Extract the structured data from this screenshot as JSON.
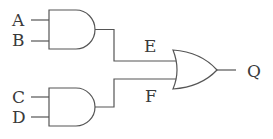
{
  "diagram": {
    "type": "logic-circuit",
    "inputs": [
      {
        "id": "A",
        "label": "A"
      },
      {
        "id": "B",
        "label": "B"
      },
      {
        "id": "C",
        "label": "C"
      },
      {
        "id": "D",
        "label": "D"
      }
    ],
    "gates": [
      {
        "id": "and1",
        "kind": "AND",
        "inputs": [
          "A",
          "B"
        ],
        "output": "E"
      },
      {
        "id": "and2",
        "kind": "AND",
        "inputs": [
          "C",
          "D"
        ],
        "output": "F"
      },
      {
        "id": "or1",
        "kind": "OR",
        "inputs": [
          "E",
          "F"
        ],
        "output": "Q"
      }
    ],
    "labels": {
      "a": "A",
      "b": "B",
      "c": "C",
      "d": "D",
      "e": "E",
      "f": "F",
      "q": "Q"
    },
    "colors": {
      "line": "#555555",
      "text": "#3a3a3a",
      "background": "#ffffff"
    }
  }
}
